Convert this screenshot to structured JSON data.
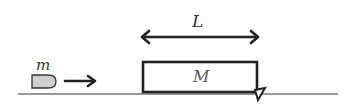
{
  "diagram": {
    "length_label": "L",
    "bullet_mass_label": "m",
    "block_mass_label": "M",
    "colors": {
      "stroke": "#222222",
      "bullet_fill": "#cfcfcf",
      "background": "#ffffff"
    }
  }
}
